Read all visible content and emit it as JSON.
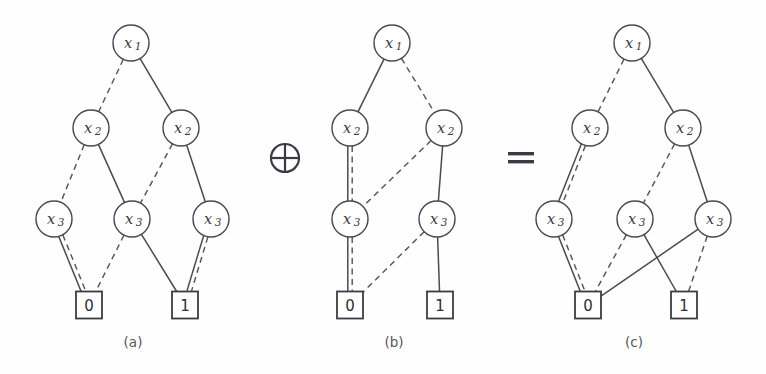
{
  "figure": {
    "background_color": "#fefefe",
    "stroke_color": "#4a4a52",
    "node_fill": "#ffffff"
  },
  "operators": [
    {
      "name": "xor-operator",
      "glyph": "⊕",
      "x": 285,
      "y": 158
    },
    {
      "name": "equals-operator",
      "glyph": "=",
      "x": 521,
      "y": 158
    }
  ],
  "captions": [
    {
      "text": "(a)",
      "x": 133,
      "y": 347
    },
    {
      "text": "(b)",
      "x": 394,
      "y": 347
    },
    {
      "text": "(c)",
      "x": 634,
      "y": 347
    }
  ],
  "diagrams": [
    {
      "id": "a",
      "caption": "(a)",
      "nodes": [
        {
          "id": "a_x1",
          "label": "x",
          "sub": "1",
          "x": 131,
          "y": 43,
          "r": 18
        },
        {
          "id": "a_x2L",
          "label": "x",
          "sub": "2",
          "x": 91,
          "y": 128,
          "r": 18
        },
        {
          "id": "a_x2R",
          "label": "x",
          "sub": "2",
          "x": 181,
          "y": 128,
          "r": 18
        },
        {
          "id": "a_x3L",
          "label": "x",
          "sub": "3",
          "x": 54,
          "y": 219,
          "r": 18
        },
        {
          "id": "a_x3M",
          "label": "x",
          "sub": "3",
          "x": 132,
          "y": 219,
          "r": 18
        },
        {
          "id": "a_x3R",
          "label": "x",
          "sub": "3",
          "x": 211,
          "y": 219,
          "r": 18
        }
      ],
      "terminals": [
        {
          "id": "a_t0",
          "label": "0",
          "x": 89,
          "y": 305,
          "w": 26,
          "h": 27
        },
        {
          "id": "a_t1",
          "label": "1",
          "x": 185,
          "y": 305,
          "w": 26,
          "h": 27
        }
      ],
      "edges": [
        {
          "from": "a_x1",
          "to": "a_x2L",
          "style": "dashed"
        },
        {
          "from": "a_x1",
          "to": "a_x2R",
          "style": "solid"
        },
        {
          "from": "a_x2L",
          "to": "a_x3L",
          "style": "dashed"
        },
        {
          "from": "a_x2L",
          "to": "a_x3M",
          "style": "solid"
        },
        {
          "from": "a_x2R",
          "to": "a_x3M",
          "style": "dashed"
        },
        {
          "from": "a_x2R",
          "to": "a_x3R",
          "style": "solid"
        },
        {
          "from": "a_x3L",
          "to": "a_t0",
          "style": "dashed"
        },
        {
          "from": "a_x3L",
          "to": "a_t0",
          "style": "solid"
        },
        {
          "from": "a_x3M",
          "to": "a_t0",
          "style": "dashed"
        },
        {
          "from": "a_x3M",
          "to": "a_t1",
          "style": "solid"
        },
        {
          "from": "a_x3R",
          "to": "a_t1",
          "style": "dashed"
        },
        {
          "from": "a_x3R",
          "to": "a_t1",
          "style": "solid"
        }
      ]
    },
    {
      "id": "b",
      "caption": "(b)",
      "nodes": [
        {
          "id": "b_x1",
          "label": "x",
          "sub": "1",
          "x": 392,
          "y": 43,
          "r": 18
        },
        {
          "id": "b_x2L",
          "label": "x",
          "sub": "2",
          "x": 350,
          "y": 128,
          "r": 18
        },
        {
          "id": "b_x2R",
          "label": "x",
          "sub": "2",
          "x": 444,
          "y": 128,
          "r": 18
        },
        {
          "id": "b_x3L",
          "label": "x",
          "sub": "3",
          "x": 350,
          "y": 219,
          "r": 18
        },
        {
          "id": "b_x3R",
          "label": "x",
          "sub": "3",
          "x": 437,
          "y": 219,
          "r": 18
        }
      ],
      "terminals": [
        {
          "id": "b_t0",
          "label": "0",
          "x": 350,
          "y": 305,
          "w": 26,
          "h": 27
        },
        {
          "id": "b_t1",
          "label": "1",
          "x": 440,
          "y": 305,
          "w": 26,
          "h": 27
        }
      ],
      "edges": [
        {
          "from": "b_x1",
          "to": "b_x2L",
          "style": "solid"
        },
        {
          "from": "b_x1",
          "to": "b_x2R",
          "style": "dashed"
        },
        {
          "from": "b_x2L",
          "to": "b_x3L",
          "style": "dashed"
        },
        {
          "from": "b_x2L",
          "to": "b_x3L",
          "style": "solid"
        },
        {
          "from": "b_x2R",
          "to": "b_x3L",
          "style": "dashed"
        },
        {
          "from": "b_x2R",
          "to": "b_x3R",
          "style": "solid"
        },
        {
          "from": "b_x3L",
          "to": "b_t0",
          "style": "dashed"
        },
        {
          "from": "b_x3L",
          "to": "b_t0",
          "style": "solid"
        },
        {
          "from": "b_x3R",
          "to": "b_t0",
          "style": "dashed"
        },
        {
          "from": "b_x3R",
          "to": "b_t1",
          "style": "solid"
        }
      ]
    },
    {
      "id": "c",
      "caption": "(c)",
      "nodes": [
        {
          "id": "c_x1",
          "label": "x",
          "sub": "1",
          "x": 632,
          "y": 43,
          "r": 18
        },
        {
          "id": "c_x2L",
          "label": "x",
          "sub": "2",
          "x": 590,
          "y": 128,
          "r": 18
        },
        {
          "id": "c_x2R",
          "label": "x",
          "sub": "2",
          "x": 683,
          "y": 128,
          "r": 18
        },
        {
          "id": "c_x3L",
          "label": "x",
          "sub": "3",
          "x": 554,
          "y": 219,
          "r": 18
        },
        {
          "id": "c_x3M",
          "label": "x",
          "sub": "3",
          "x": 635,
          "y": 219,
          "r": 18
        },
        {
          "id": "c_x3R",
          "label": "x",
          "sub": "3",
          "x": 713,
          "y": 219,
          "r": 18
        }
      ],
      "terminals": [
        {
          "id": "c_t0",
          "label": "0",
          "x": 588,
          "y": 305,
          "w": 26,
          "h": 27
        },
        {
          "id": "c_t1",
          "label": "1",
          "x": 684,
          "y": 305,
          "w": 26,
          "h": 27
        }
      ],
      "edges": [
        {
          "from": "c_x1",
          "to": "c_x2L",
          "style": "dashed"
        },
        {
          "from": "c_x1",
          "to": "c_x2R",
          "style": "solid"
        },
        {
          "from": "c_x2L",
          "to": "c_x3L",
          "style": "dashed"
        },
        {
          "from": "c_x2L",
          "to": "c_x3L",
          "style": "solid"
        },
        {
          "from": "c_x2R",
          "to": "c_x3M",
          "style": "dashed"
        },
        {
          "from": "c_x2R",
          "to": "c_x3R",
          "style": "solid"
        },
        {
          "from": "c_x3L",
          "to": "c_t0",
          "style": "dashed"
        },
        {
          "from": "c_x3L",
          "to": "c_t0",
          "style": "solid"
        },
        {
          "from": "c_x3M",
          "to": "c_t0",
          "style": "dashed"
        },
        {
          "from": "c_x3M",
          "to": "c_t1",
          "style": "solid"
        },
        {
          "from": "c_x3R",
          "to": "c_t0",
          "style": "solid"
        },
        {
          "from": "c_x3R",
          "to": "c_t1",
          "style": "dashed"
        }
      ]
    }
  ]
}
